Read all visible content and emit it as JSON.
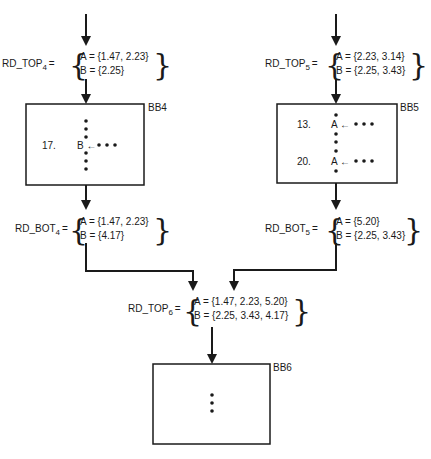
{
  "diagram": {
    "sets": {
      "rd_top4": {
        "name": "RD_TOP",
        "sub": "4",
        "eq": "=",
        "a": "A =  {1.47, 2.23}",
        "b": "B =  {2.25}"
      },
      "rd_top5": {
        "name": "RD_TOP",
        "sub": "5",
        "eq": "=",
        "a": "A =  {2.23, 3.14}",
        "b": "B =  {2.25, 3.43}"
      },
      "rd_bot4": {
        "name": "RD_BOT",
        "sub": "4",
        "eq": "=",
        "a": "A =  {1.47, 2.23}",
        "b": "B =  {4.17}"
      },
      "rd_bot5": {
        "name": "RD_BOT",
        "sub": "5",
        "eq": "=",
        "a": "A =  {5.20}",
        "b": "B =  {2.25, 3.43}"
      },
      "rd_top6": {
        "name": "RD_TOP",
        "sub": "6",
        "eq": "=",
        "a": "A =  {1.47, 2.23, 5.20}",
        "b": "B =  {2.25, 3.43, 4.17}"
      }
    },
    "blocks": {
      "bb4": {
        "label": "BB4",
        "statements": [
          {
            "num": "17.",
            "text": "B ←"
          }
        ]
      },
      "bb5": {
        "label": "BB5",
        "statements": [
          {
            "num": "13.",
            "text": "A ←"
          },
          {
            "num": "20.",
            "text": "A ←"
          }
        ]
      },
      "bb6": {
        "label": "BB6",
        "statements": []
      }
    },
    "colors": {
      "line": "#1a1a1a",
      "background": "#ffffff"
    }
  }
}
